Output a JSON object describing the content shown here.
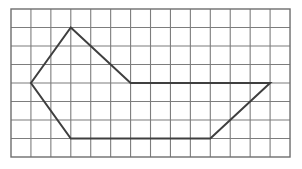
{
  "figure": {
    "background_color": "#ffffff",
    "canvas": {
      "width": 302,
      "height": 169
    }
  },
  "grid": {
    "name": "square-lattice-grid",
    "columns": 14,
    "rows": 8,
    "origin_x": 11,
    "origin_y": 9,
    "cell_width": 19.93,
    "cell_height": 18.5,
    "line_color": "#7d7d7d",
    "line_width": 1.1,
    "border_color": "#6e6e6e",
    "border_width": 1.4,
    "visible": true
  },
  "chart_data": {
    "type": "scatter",
    "xlabel": "",
    "ylabel": "",
    "xlim": [
      0,
      14
    ],
    "ylim": [
      0,
      8
    ],
    "grid": true,
    "legend": "none",
    "series": [
      {
        "name": "polygon-outline",
        "closed": true,
        "color": "#3f3f3f",
        "line_width": 2.0,
        "vertices": [
          {
            "label": "left-vertex",
            "x": 1,
            "y": 4
          },
          {
            "label": "top-peak-vertex",
            "x": 3,
            "y": 1
          },
          {
            "label": "middle-right-vertex",
            "x": 6,
            "y": 4
          },
          {
            "label": "far-right-vertex",
            "x": 13,
            "y": 4
          },
          {
            "label": "bottom-right-vertex",
            "x": 10,
            "y": 7
          },
          {
            "label": "bottom-left-vertex",
            "x": 3,
            "y": 7
          }
        ],
        "edges": [
          {
            "label": "left-to-peak-edge",
            "from": 0,
            "to": 1
          },
          {
            "label": "peak-to-middle-edge",
            "from": 1,
            "to": 2
          },
          {
            "label": "middle-to-far-right-edge",
            "from": 2,
            "to": 3
          },
          {
            "label": "far-right-to-bottom-right-edge",
            "from": 3,
            "to": 4
          },
          {
            "label": "bottom-horizontal-edge",
            "from": 4,
            "to": 5
          },
          {
            "label": "bottom-left-to-left-edge",
            "from": 5,
            "to": 0
          }
        ]
      }
    ]
  }
}
